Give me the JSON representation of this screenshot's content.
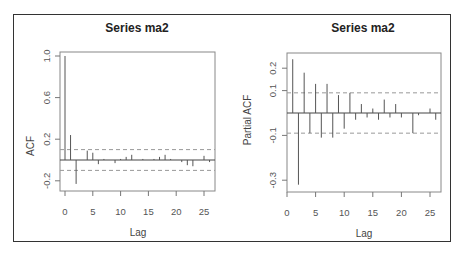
{
  "chart_data": [
    {
      "type": "bar",
      "title": "Series  ma2",
      "xlabel": "Lag",
      "ylabel": "ACF",
      "xlim": [
        0,
        26
      ],
      "ylim": [
        -0.3,
        1.05
      ],
      "x_ticks": [
        0,
        5,
        10,
        15,
        20,
        25
      ],
      "y_ticks": [
        1.0,
        0.6,
        0.2,
        -0.2
      ],
      "y_tick_labels": [
        "1.0",
        "0.6",
        "0.2",
        "-0.2"
      ],
      "confidence_band": 0.1,
      "x": [
        0,
        1,
        2,
        3,
        4,
        5,
        6,
        7,
        8,
        9,
        10,
        11,
        12,
        13,
        14,
        15,
        16,
        17,
        18,
        19,
        20,
        21,
        22,
        23,
        24,
        25,
        26
      ],
      "values": [
        1.0,
        0.24,
        -0.23,
        0.0,
        0.09,
        0.07,
        -0.04,
        0.01,
        0.0,
        -0.03,
        0.01,
        0.03,
        0.05,
        0.0,
        0.01,
        0.0,
        0.01,
        0.03,
        0.05,
        0.01,
        0.0,
        -0.02,
        -0.05,
        -0.06,
        0.0,
        0.04,
        -0.02
      ]
    },
    {
      "type": "bar",
      "title": "Series  ma2",
      "xlabel": "Lag",
      "ylabel": "Partial ACF",
      "xlim": [
        0,
        27
      ],
      "ylim": [
        -0.34,
        0.26
      ],
      "x_ticks": [
        0,
        5,
        10,
        15,
        20,
        25
      ],
      "y_ticks": [
        0.2,
        0.1,
        -0.1,
        -0.3
      ],
      "y_tick_labels": [
        "0.2",
        "0.1",
        "-0.1",
        "-0.3"
      ],
      "confidence_band": 0.09,
      "x": [
        1,
        2,
        3,
        4,
        5,
        6,
        7,
        8,
        9,
        10,
        11,
        12,
        13,
        14,
        15,
        16,
        17,
        18,
        19,
        20,
        21,
        22,
        23,
        24,
        25,
        26
      ],
      "values": [
        0.24,
        -0.32,
        0.18,
        -0.09,
        0.13,
        -0.11,
        0.13,
        -0.11,
        0.08,
        -0.07,
        0.09,
        -0.03,
        0.04,
        -0.02,
        0.02,
        -0.03,
        0.06,
        -0.02,
        0.04,
        -0.02,
        0.0,
        -0.09,
        -0.01,
        0.0,
        0.02,
        -0.03
      ]
    }
  ],
  "labels": {
    "left_title": "Series  ma2",
    "right_title": "Series  ma2",
    "left_xlabel": "Lag",
    "right_xlabel": "Lag",
    "left_ylabel": "ACF",
    "right_ylabel": "Partial ACF"
  }
}
